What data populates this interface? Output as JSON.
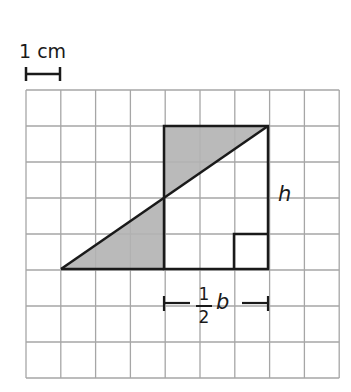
{
  "scale": {
    "label": "1 cm"
  },
  "grid": {
    "columns": 9,
    "rows": 8,
    "x0": 26,
    "y0": 90,
    "cell_w": 34.8,
    "cell_h": 36,
    "line_color": "#a6a6a6"
  },
  "figure": {
    "shade_color": "#b3b3b3",
    "stroke_color": "#1a1a1a",
    "rectangle": {
      "x1": 164,
      "y1": 126,
      "x2": 268,
      "y2": 269
    },
    "triangle_points": "61,269 164,269 164,198",
    "top_triangle_points": "164,126 268,126 164,198",
    "diagonal": {
      "x1": 61,
      "y1": 269,
      "x2": 268,
      "y2": 126
    },
    "right_angle_box": {
      "x": 234,
      "y": 234,
      "size": 35
    }
  },
  "labels": {
    "height": "h",
    "base_fraction_numerator": "1",
    "base_fraction_denominator": "2",
    "base_variable": "b"
  }
}
